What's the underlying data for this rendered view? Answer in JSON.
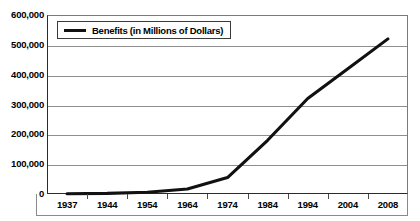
{
  "chart_data": {
    "type": "line",
    "title": "",
    "subtitle": "",
    "xlabel": "",
    "ylabel": "",
    "grid": true,
    "legend_position": "top-left-inside",
    "categories": [
      "1937",
      "1944",
      "1954",
      "1964",
      "1974",
      "1984",
      "1994",
      "2004",
      "2008"
    ],
    "x": [
      1937,
      1944,
      1954,
      1964,
      1974,
      1984,
      1994,
      2004,
      2008
    ],
    "ylim": [
      0,
      600000
    ],
    "ytick_values": [
      0,
      100000,
      200000,
      300000,
      400000,
      500000,
      600000
    ],
    "ytick_labels": [
      "0",
      "100,000",
      "200,000",
      "300,000",
      "400,000",
      "500,000",
      "600,000"
    ],
    "series": [
      {
        "name": "Benefits (in Millions of Dollars)",
        "color": "#111111",
        "values": [
          1000,
          2000,
          6000,
          17000,
          55000,
          180000,
          320000,
          420000,
          520000
        ]
      }
    ]
  },
  "legend": {
    "entries": [
      {
        "label": "Benefits (in Millions of Dollars)",
        "swatch_icon": "line-swatch-icon",
        "color": "#111111"
      }
    ]
  },
  "axes": {
    "y": {
      "labels": [
        "600,000",
        "500,000",
        "400,000",
        "300,000",
        "200,000",
        "100,000",
        "0"
      ]
    },
    "x": {
      "labels": [
        "1937",
        "1944",
        "1954",
        "1964",
        "1974",
        "1984",
        "1994",
        "2004",
        "2008"
      ]
    }
  }
}
